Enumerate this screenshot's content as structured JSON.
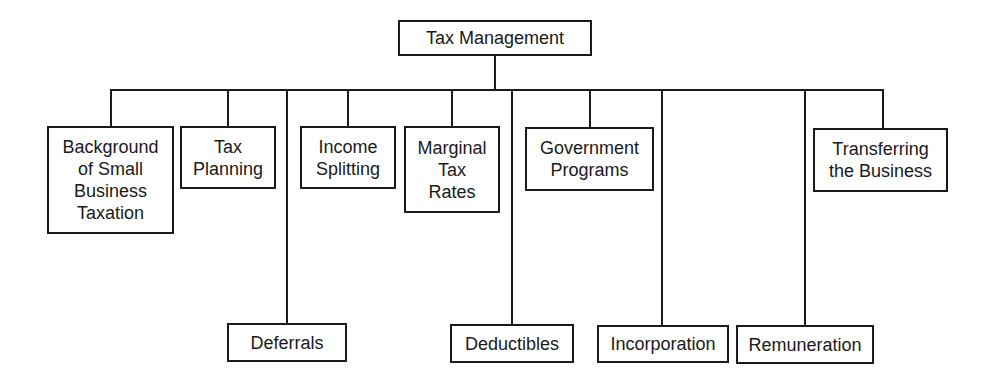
{
  "diagram": {
    "type": "org-chart",
    "root": {
      "label": "Tax Management"
    },
    "children": [
      {
        "id": "background",
        "label": "Background\nof Small\nBusiness\nTaxation",
        "level": "upper"
      },
      {
        "id": "tax-planning",
        "label": "Tax\nPlanning",
        "level": "upper"
      },
      {
        "id": "deferrals",
        "label": "Deferrals",
        "level": "lower"
      },
      {
        "id": "income-splitting",
        "label": "Income\nSplitting",
        "level": "upper"
      },
      {
        "id": "marginal-tax-rates",
        "label": "Marginal\nTax\nRates",
        "level": "upper"
      },
      {
        "id": "deductibles",
        "label": "Deductibles",
        "level": "lower"
      },
      {
        "id": "government-programs",
        "label": "Government\nPrograms",
        "level": "upper"
      },
      {
        "id": "incorporation",
        "label": "Incorporation",
        "level": "lower"
      },
      {
        "id": "remuneration",
        "label": "Remuneration",
        "level": "lower"
      },
      {
        "id": "transferring-the-business",
        "label": "Transferring\nthe Business",
        "level": "upper"
      }
    ]
  }
}
